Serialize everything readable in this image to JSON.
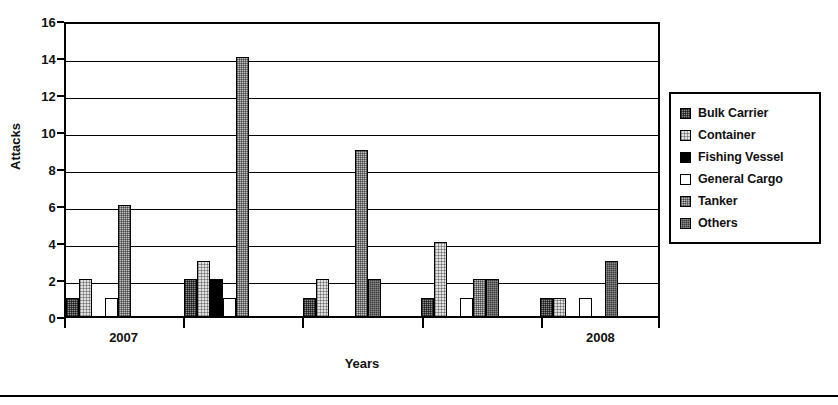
{
  "chart_data": {
    "type": "bar",
    "title": "",
    "xlabel": "Years",
    "ylabel": "Attacks",
    "ylim": [
      0,
      16
    ],
    "yticks": [
      0,
      2,
      4,
      6,
      8,
      10,
      12,
      14,
      16
    ],
    "grid": true,
    "legend_position": "right",
    "categories": [
      "2007",
      "",
      "",
      "",
      "2008"
    ],
    "x_tick_labels": [
      "2007",
      "2008"
    ],
    "series": [
      {
        "name": "Bulk Carrier",
        "key": "bulk",
        "swatch": "medium-gray-dither",
        "values": [
          1,
          2,
          1,
          1,
          1
        ]
      },
      {
        "name": "Container",
        "key": "container",
        "swatch": "light-gray-dither",
        "values": [
          2,
          3,
          2,
          4,
          1
        ]
      },
      {
        "name": "Fishing Vessel",
        "key": "fishing",
        "swatch": "solid-black",
        "values": [
          0,
          2,
          0,
          0,
          0
        ]
      },
      {
        "name": "General Cargo",
        "key": "cargo",
        "swatch": "white",
        "values": [
          1,
          1,
          0,
          1,
          1
        ]
      },
      {
        "name": "Tanker",
        "key": "tanker",
        "swatch": "pale-gray-dither",
        "values": [
          6,
          14,
          9,
          2,
          0
        ]
      },
      {
        "name": "Others",
        "key": "others",
        "swatch": "dark-gray-dither",
        "values": [
          0,
          0,
          2,
          2,
          3
        ]
      }
    ]
  },
  "legend": {
    "items": [
      {
        "label": "Bulk Carrier"
      },
      {
        "label": "Container"
      },
      {
        "label": "Fishing Vessel"
      },
      {
        "label": "General Cargo"
      },
      {
        "label": "Tanker"
      },
      {
        "label": "Others"
      }
    ]
  }
}
